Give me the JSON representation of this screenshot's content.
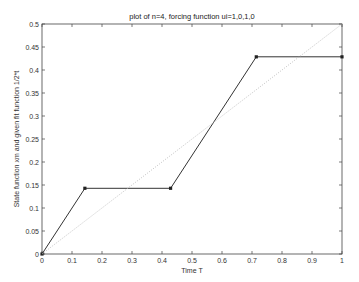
{
  "chart_data": {
    "type": "line",
    "title": "plot of n=4, forcing function ui=1,0,1,0",
    "xlabel": "Time T",
    "ylabel": "State function xm and given fit function 1/2*t",
    "xlim": [
      0,
      1
    ],
    "ylim": [
      0,
      0.5
    ],
    "xticks": [
      "0",
      "0.1",
      "0.2",
      "0.3",
      "0.4",
      "0.5",
      "0.6",
      "0.7",
      "0.8",
      "0.9",
      "1"
    ],
    "yticks": [
      "0",
      "0.05",
      "0.1",
      "0.15",
      "0.2",
      "0.25",
      "0.3",
      "0.35",
      "0.4",
      "0.45",
      "0.5"
    ],
    "grid": false,
    "legend": null,
    "series": [
      {
        "name": "State function xm",
        "style": "solid",
        "marker": "square",
        "color": "#333333",
        "x": [
          0,
          0.1429,
          0.4286,
          0.7143,
          1.0
        ],
        "y": [
          0,
          0.1429,
          0.1429,
          0.4286,
          0.4286
        ]
      },
      {
        "name": "Fit function 1/2*t",
        "style": "dotted",
        "marker": "none",
        "color": "#bbbbbb",
        "x": [
          0,
          1
        ],
        "y": [
          0,
          0.5
        ]
      }
    ]
  }
}
